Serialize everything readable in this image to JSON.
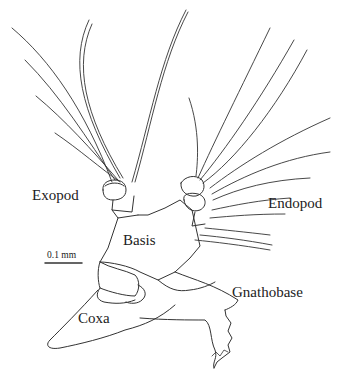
{
  "figure": {
    "type": "scientific line drawing of crustacean appendage",
    "line_color": "#333333",
    "background": "#ffffff"
  },
  "labels": {
    "exopod": "Exopod",
    "endopod": "Endopod",
    "basis": "Basis",
    "coxa": "Coxa",
    "gnathobase": "Gnathobase"
  },
  "scale_bar": {
    "label": "0.1 mm"
  }
}
